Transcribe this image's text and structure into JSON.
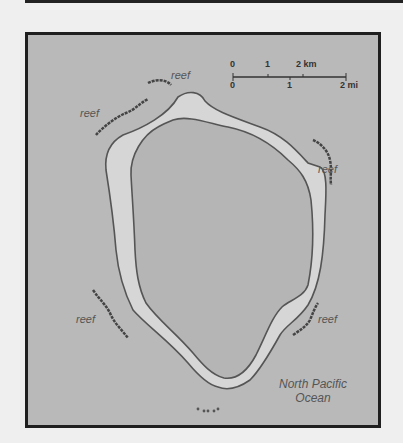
{
  "map": {
    "title": "",
    "scale": {
      "km_ticks": [
        "0",
        "1",
        "2 km"
      ],
      "mi_ticks": [
        "0",
        "1",
        "2 mi"
      ]
    },
    "labels": {
      "reef_n": "reef",
      "reef_nw": "reef",
      "reef_e": "reef",
      "reef_sw": "reef",
      "reef_se": "reef",
      "ocean_line1": "North Pacific",
      "ocean_line2": "Ocean"
    },
    "colors": {
      "water": "#b9b9b9",
      "land": "#d6d6d6",
      "lagoon": "#b5b5b5",
      "coastline": "#555555",
      "reef": "#444444",
      "frame": "#1f1f1f"
    }
  }
}
